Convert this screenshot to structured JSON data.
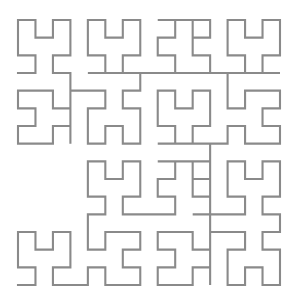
{
  "figure": {
    "kind": "space-filling-curve",
    "curve_name": "Hilbert curve",
    "order": 4,
    "grid_size": 16,
    "cell_count": 256,
    "background_color": "#ffffff",
    "stroke_color": "#8a8a8a",
    "stroke_width": 2.1,
    "canvas": {
      "width": 295,
      "height": 300
    },
    "plot_area": {
      "x": 18,
      "y": 20,
      "width": 262,
      "height": 265
    },
    "start_point": {
      "x": 0,
      "y": 0
    },
    "end_point": {
      "x": 15,
      "y": 0
    }
  },
  "chart_data": {
    "type": "line",
    "subtitle": "",
    "xlabel": "",
    "ylabel": "",
    "xlim": [
      0,
      15
    ],
    "ylim": [
      0,
      15
    ],
    "grid": false,
    "legend": false,
    "legend_position": "none",
    "tick_labels_x": [],
    "tick_labels_y": [],
    "annotations": [],
    "series": [
      {
        "name": "hilbert-order-4",
        "color": "#8a8a8a",
        "closed": false,
        "points": [
          [
            0,
            0
          ],
          [
            1,
            0
          ],
          [
            1,
            1
          ],
          [
            0,
            1
          ],
          [
            0,
            2
          ],
          [
            0,
            3
          ],
          [
            1,
            3
          ],
          [
            1,
            2
          ],
          [
            2,
            2
          ],
          [
            2,
            3
          ],
          [
            3,
            3
          ],
          [
            3,
            2
          ],
          [
            3,
            1
          ],
          [
            2,
            1
          ],
          [
            2,
            0
          ],
          [
            3,
            0
          ],
          [
            4,
            0
          ],
          [
            4,
            1
          ],
          [
            5,
            1
          ],
          [
            5,
            0
          ],
          [
            6,
            0
          ],
          [
            7,
            0
          ],
          [
            7,
            1
          ],
          [
            6,
            1
          ],
          [
            6,
            2
          ],
          [
            7,
            2
          ],
          [
            7,
            3
          ],
          [
            6,
            3
          ],
          [
            5,
            3
          ],
          [
            5,
            2
          ],
          [
            4,
            2
          ],
          [
            4,
            3
          ],
          [
            4,
            4
          ],
          [
            5,
            4
          ],
          [
            5,
            5
          ],
          [
            4,
            5
          ],
          [
            4,
            6
          ],
          [
            4,
            7
          ],
          [
            5,
            7
          ],
          [
            5,
            6
          ],
          [
            6,
            6
          ],
          [
            6,
            7
          ],
          [
            7,
            7
          ],
          [
            7,
            6
          ],
          [
            7,
            5
          ],
          [
            6,
            5
          ],
          [
            6,
            4
          ],
          [
            7,
            4
          ],
          [
            8,
            4
          ],
          [
            9,
            4
          ],
          [
            9,
            5
          ],
          [
            8,
            5
          ],
          [
            8,
            6
          ],
          [
            9,
            6
          ],
          [
            9,
            7
          ],
          [
            8,
            7
          ],
          [
            11,
            7
          ],
          [
            11,
            6
          ],
          [
            10,
            6
          ],
          [
            10,
            7
          ],
          [
            10,
            5
          ],
          [
            11,
            5
          ],
          [
            11,
            4
          ],
          [
            10,
            4
          ],
          [
            12,
            4
          ],
          [
            13,
            4
          ],
          [
            13,
            5
          ],
          [
            12,
            5
          ],
          [
            12,
            6
          ],
          [
            12,
            7
          ],
          [
            13,
            7
          ],
          [
            13,
            6
          ],
          [
            14,
            6
          ],
          [
            14,
            7
          ],
          [
            15,
            7
          ],
          [
            15,
            6
          ],
          [
            15,
            5
          ],
          [
            14,
            5
          ],
          [
            14,
            4
          ],
          [
            15,
            4
          ],
          [
            15,
            3
          ],
          [
            14,
            3
          ],
          [
            14,
            2
          ],
          [
            15,
            2
          ],
          [
            15,
            1
          ],
          [
            15,
            0
          ],
          [
            14,
            0
          ],
          [
            14,
            1
          ],
          [
            13,
            1
          ],
          [
            13,
            0
          ],
          [
            12,
            0
          ],
          [
            12,
            1
          ],
          [
            12,
            2
          ],
          [
            13,
            2
          ],
          [
            13,
            3
          ],
          [
            12,
            3
          ],
          [
            11,
            3
          ],
          [
            11,
            2
          ],
          [
            10,
            2
          ],
          [
            10,
            3
          ],
          [
            9,
            3
          ],
          [
            8,
            3
          ],
          [
            8,
            2
          ],
          [
            9,
            2
          ],
          [
            9,
            1
          ],
          [
            8,
            1
          ],
          [
            8,
            0
          ],
          [
            9,
            0
          ],
          [
            10,
            0
          ],
          [
            10,
            1
          ],
          [
            11,
            1
          ],
          [
            11,
            0
          ],
          [
            11,
            8
          ],
          [
            10,
            8
          ],
          [
            10,
            9
          ],
          [
            11,
            9
          ],
          [
            11,
            10
          ],
          [
            11,
            11
          ],
          [
            10,
            11
          ],
          [
            10,
            10
          ],
          [
            9,
            10
          ],
          [
            9,
            11
          ],
          [
            8,
            11
          ],
          [
            8,
            10
          ],
          [
            8,
            9
          ],
          [
            9,
            9
          ],
          [
            9,
            8
          ],
          [
            8,
            8
          ],
          [
            12,
            8
          ],
          [
            12,
            9
          ],
          [
            13,
            9
          ],
          [
            13,
            8
          ],
          [
            14,
            8
          ],
          [
            15,
            8
          ],
          [
            15,
            9
          ],
          [
            14,
            9
          ],
          [
            14,
            10
          ],
          [
            15,
            10
          ],
          [
            15,
            11
          ],
          [
            14,
            11
          ],
          [
            13,
            11
          ],
          [
            13,
            10
          ],
          [
            12,
            10
          ],
          [
            12,
            11
          ],
          [
            12,
            12
          ],
          [
            13,
            12
          ],
          [
            13,
            13
          ],
          [
            12,
            13
          ],
          [
            12,
            14
          ],
          [
            12,
            15
          ],
          [
            13,
            15
          ],
          [
            13,
            14
          ],
          [
            14,
            14
          ],
          [
            14,
            15
          ],
          [
            15,
            15
          ],
          [
            15,
            14
          ],
          [
            15,
            13
          ],
          [
            14,
            13
          ],
          [
            14,
            12
          ],
          [
            15,
            12
          ],
          [
            8,
            12
          ],
          [
            9,
            12
          ],
          [
            9,
            13
          ],
          [
            8,
            13
          ],
          [
            8,
            14
          ],
          [
            9,
            14
          ],
          [
            9,
            15
          ],
          [
            8,
            15
          ],
          [
            11,
            15
          ],
          [
            11,
            14
          ],
          [
            10,
            14
          ],
          [
            10,
            15
          ],
          [
            10,
            13
          ],
          [
            11,
            13
          ],
          [
            11,
            12
          ],
          [
            10,
            12
          ],
          [
            4,
            12
          ],
          [
            5,
            12
          ],
          [
            5,
            13
          ],
          [
            4,
            13
          ],
          [
            4,
            14
          ],
          [
            4,
            15
          ],
          [
            5,
            15
          ],
          [
            5,
            14
          ],
          [
            6,
            14
          ],
          [
            6,
            15
          ],
          [
            7,
            15
          ],
          [
            7,
            14
          ],
          [
            7,
            13
          ],
          [
            6,
            13
          ],
          [
            6,
            12
          ],
          [
            7,
            12
          ],
          [
            7,
            11
          ],
          [
            6,
            11
          ],
          [
            6,
            10
          ],
          [
            7,
            10
          ],
          [
            7,
            9
          ],
          [
            7,
            8
          ],
          [
            6,
            8
          ],
          [
            6,
            9
          ],
          [
            5,
            9
          ],
          [
            5,
            8
          ],
          [
            4,
            8
          ],
          [
            4,
            9
          ],
          [
            4,
            10
          ],
          [
            5,
            10
          ],
          [
            5,
            11
          ],
          [
            4,
            11
          ],
          [
            3,
            11
          ],
          [
            3,
            10
          ],
          [
            2,
            10
          ],
          [
            2,
            11
          ],
          [
            1,
            11
          ],
          [
            0,
            11
          ],
          [
            0,
            10
          ],
          [
            1,
            10
          ],
          [
            1,
            9
          ],
          [
            0,
            9
          ],
          [
            0,
            8
          ],
          [
            1,
            8
          ],
          [
            2,
            8
          ],
          [
            2,
            9
          ],
          [
            3,
            9
          ],
          [
            3,
            8
          ],
          [
            3,
            12
          ],
          [
            2,
            12
          ],
          [
            2,
            13
          ],
          [
            3,
            13
          ],
          [
            3,
            14
          ],
          [
            3,
            15
          ],
          [
            2,
            15
          ],
          [
            2,
            14
          ],
          [
            1,
            14
          ],
          [
            1,
            15
          ],
          [
            0,
            15
          ],
          [
            0,
            14
          ],
          [
            0,
            13
          ],
          [
            1,
            13
          ],
          [
            1,
            12
          ],
          [
            0,
            12
          ]
        ]
      }
    ]
  }
}
